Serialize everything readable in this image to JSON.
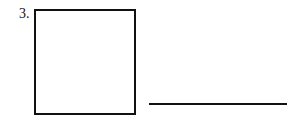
{
  "problem": {
    "number": "3.",
    "figure": "square",
    "answer_blank": ""
  }
}
